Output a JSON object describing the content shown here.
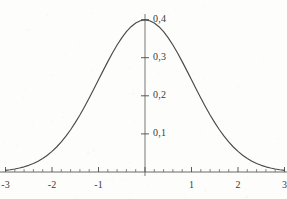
{
  "chart_data": {
    "type": "line",
    "title": "",
    "subtitle": "",
    "xlabel": "",
    "ylabel": "",
    "xlim": [
      -3,
      3
    ],
    "ylim": [
      0,
      0.42
    ],
    "grid": false,
    "legend": null,
    "decimal_separator": ",",
    "x_tick_labels": [
      "-3",
      "-2",
      "-1",
      "1",
      "2",
      "3"
    ],
    "x_tick_values": [
      -3,
      -2,
      -1,
      1,
      2,
      3
    ],
    "x_minor_tick_step": 0.2,
    "y_tick_labels": [
      "0,1",
      "0,2",
      "0,3",
      "0,4"
    ],
    "y_tick_values": [
      0.1,
      0.2,
      0.3,
      0.4
    ],
    "series": [
      {
        "name": "standard normal density",
        "color": "#4a4a4a",
        "x": [
          -3,
          -2.9,
          -2.8,
          -2.7,
          -2.6,
          -2.5,
          -2.4,
          -2.3,
          -2.2,
          -2.1,
          -2,
          -1.9,
          -1.8,
          -1.7,
          -1.6,
          -1.5,
          -1.4,
          -1.3,
          -1.2,
          -1.1,
          -1,
          -0.9,
          -0.8,
          -0.7,
          -0.6,
          -0.5,
          -0.4,
          -0.3,
          -0.2,
          -0.1,
          0,
          0.1,
          0.2,
          0.3,
          0.4,
          0.5,
          0.6,
          0.7,
          0.8,
          0.9,
          1,
          1.1,
          1.2,
          1.3,
          1.4,
          1.5,
          1.6,
          1.7,
          1.8,
          1.9,
          2,
          2.1,
          2.2,
          2.3,
          2.4,
          2.5,
          2.6,
          2.7,
          2.8,
          2.9,
          3
        ],
        "y": [
          0.0044,
          0.006,
          0.0079,
          0.0104,
          0.0136,
          0.0175,
          0.0224,
          0.0283,
          0.0355,
          0.044,
          0.054,
          0.0656,
          0.079,
          0.094,
          0.1109,
          0.1295,
          0.1497,
          0.1714,
          0.1942,
          0.2179,
          0.242,
          0.2661,
          0.2897,
          0.3123,
          0.3332,
          0.3521,
          0.3683,
          0.3814,
          0.391,
          0.397,
          0.3989,
          0.397,
          0.391,
          0.3814,
          0.3683,
          0.3521,
          0.3332,
          0.3123,
          0.2897,
          0.2661,
          0.242,
          0.2179,
          0.1942,
          0.1714,
          0.1497,
          0.1295,
          0.1109,
          0.094,
          0.079,
          0.0656,
          0.054,
          0.044,
          0.0355,
          0.0283,
          0.0224,
          0.0175,
          0.0136,
          0.0104,
          0.0079,
          0.006,
          0.0044
        ]
      }
    ],
    "peak": {
      "x": 0,
      "y": 0.3989
    }
  },
  "axes": {
    "x_axis_name": "horizontal-axis",
    "y_axis_name": "vertical-axis",
    "axis_color": "#555555"
  }
}
